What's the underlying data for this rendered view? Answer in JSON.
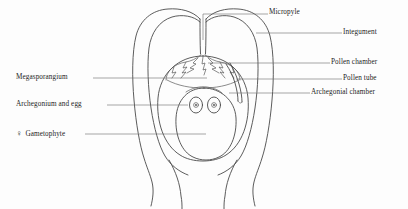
{
  "figure": {
    "background_color": "#fdfdfd",
    "line_color": "#4a4a4a",
    "text_color": "#1c1c1c"
  },
  "labels": {
    "micropyle": "Micropyle",
    "integument": "Integument",
    "pollen_chamber": "Pollen chamber",
    "pollen_tube": "Pollen tube",
    "archegonial_chamber": "Archegonial chamber",
    "megasporangium": "Megasporangium",
    "archegonium_and_egg": "Archegonium and egg",
    "gametophyte_symbol": "♀",
    "gametophyte": "Gametophyte"
  },
  "structures": [
    {
      "name": "integument",
      "description": "outer two-lobed wall of the ovule"
    },
    {
      "name": "micropyle",
      "description": "narrow channel at the apex between integument lobes"
    },
    {
      "name": "pollen-chamber",
      "description": "jagged cavity beneath the micropyle"
    },
    {
      "name": "pollen-tube",
      "description": "tube descending along the right of the megasporangium"
    },
    {
      "name": "megasporangium",
      "description": "inner oval body (nucellus)"
    },
    {
      "name": "archegonial-chamber",
      "description": "small chamber above the archegonia"
    },
    {
      "name": "female-gametophyte",
      "description": "large inner oval tissue"
    },
    {
      "name": "archegonia",
      "count": 2,
      "description": "two ovals each containing an egg"
    },
    {
      "name": "stalk",
      "description": "funiculus narrowing at the base"
    }
  ]
}
